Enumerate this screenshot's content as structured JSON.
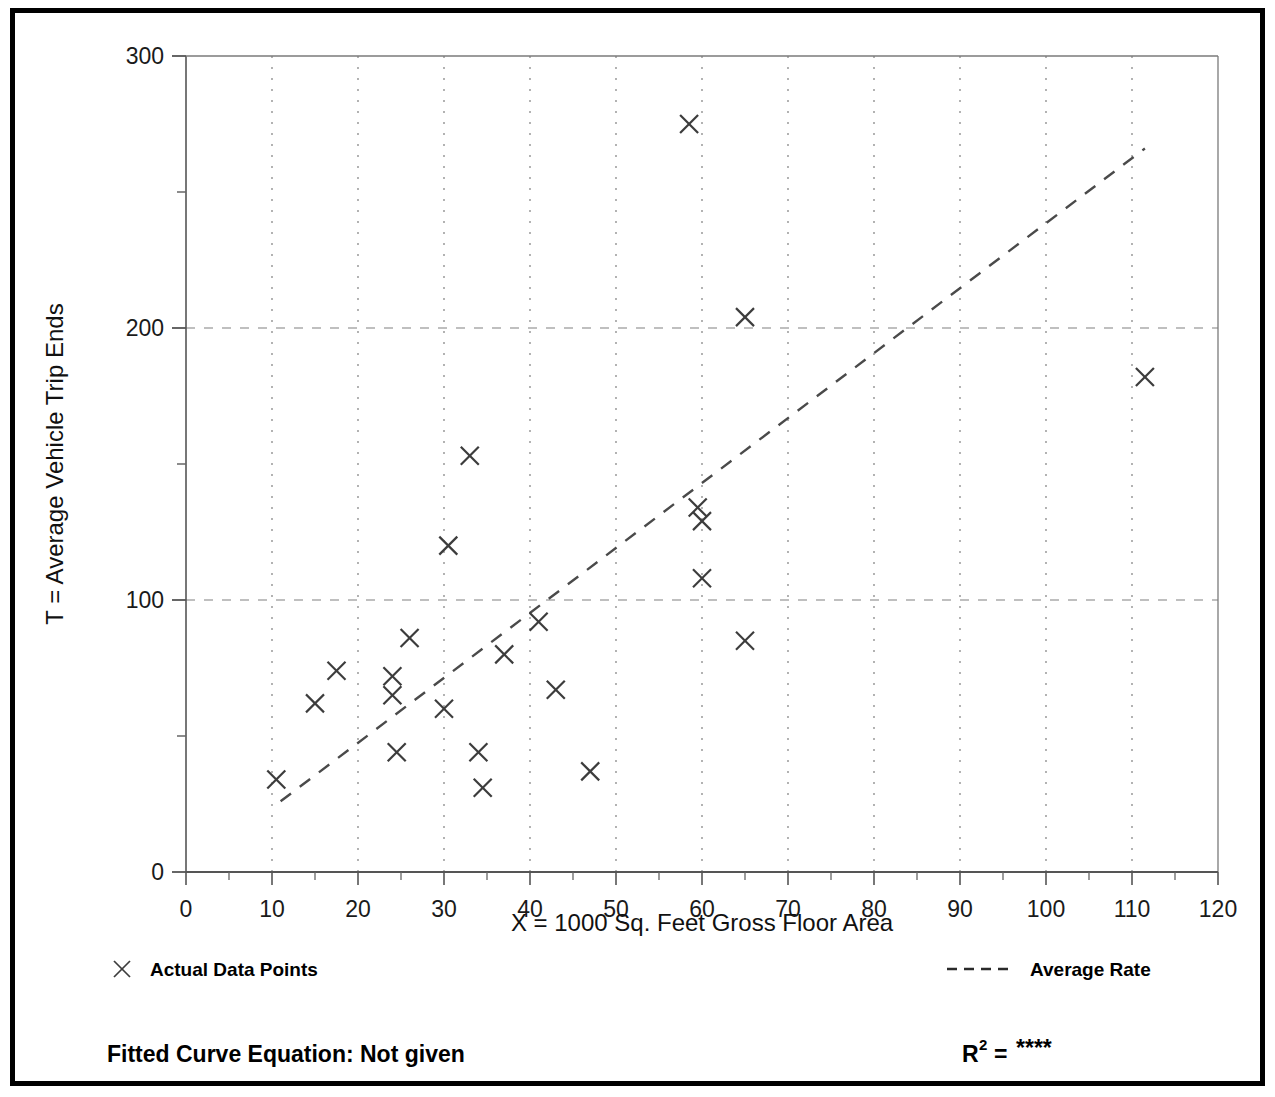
{
  "chart_data": {
    "type": "scatter",
    "title": "",
    "xlabel": "X = 1000 Sq. Feet Gross Floor Area",
    "ylabel": "T = Average Vehicle Trip Ends",
    "xlim": [
      0,
      120
    ],
    "ylim": [
      0,
      300
    ],
    "xticks": [
      0,
      10,
      20,
      30,
      40,
      50,
      60,
      70,
      80,
      90,
      100,
      110,
      120
    ],
    "yticks": [
      0,
      100,
      200,
      300
    ],
    "y_minor_ticks": [
      50,
      150,
      250
    ],
    "grid": "dotted-both-axes",
    "legend_position": "below-plot",
    "series": [
      {
        "name": "Actual Data Points",
        "marker": "x",
        "points": [
          {
            "x": 10.5,
            "y": 34
          },
          {
            "x": 15.0,
            "y": 62
          },
          {
            "x": 17.5,
            "y": 74
          },
          {
            "x": 24.0,
            "y": 72
          },
          {
            "x": 24.0,
            "y": 65
          },
          {
            "x": 24.5,
            "y": 44
          },
          {
            "x": 26.0,
            "y": 86
          },
          {
            "x": 30.0,
            "y": 60
          },
          {
            "x": 30.5,
            "y": 120
          },
          {
            "x": 33.0,
            "y": 153
          },
          {
            "x": 34.0,
            "y": 44
          },
          {
            "x": 34.5,
            "y": 31
          },
          {
            "x": 37.0,
            "y": 80
          },
          {
            "x": 41.0,
            "y": 92
          },
          {
            "x": 43.0,
            "y": 67
          },
          {
            "x": 47.0,
            "y": 37
          },
          {
            "x": 58.5,
            "y": 275
          },
          {
            "x": 59.5,
            "y": 134
          },
          {
            "x": 60.0,
            "y": 129
          },
          {
            "x": 60.0,
            "y": 108
          },
          {
            "x": 65.0,
            "y": 204
          },
          {
            "x": 65.0,
            "y": 85
          },
          {
            "x": 111.5,
            "y": 182
          }
        ]
      },
      {
        "name": "Average Rate",
        "type": "line",
        "style": "dashed",
        "endpoints": [
          {
            "x": 11.0,
            "y": 26
          },
          {
            "x": 111.5,
            "y": 266
          }
        ]
      }
    ]
  },
  "axes": {
    "x_tick_labels": [
      "0",
      "10",
      "20",
      "30",
      "40",
      "50",
      "60",
      "70",
      "80",
      "90",
      "100",
      "110",
      "120"
    ],
    "y_tick_labels": [
      "0",
      "100",
      "200",
      "300"
    ],
    "x_axis_title": "X = 1000 Sq. Feet Gross Floor Area",
    "y_axis_title": "T = Average Vehicle Trip Ends"
  },
  "legend": {
    "data_points_label": "Actual Data Points",
    "average_rate_label": "Average Rate"
  },
  "footer": {
    "fitted_curve_label": "Fitted Curve Equation:  Not given",
    "r_squared_base": "R",
    "r_squared_exponent": "2",
    "r_squared_equals": "=",
    "r_squared_value": "****"
  },
  "colors": {
    "frame": "#000000",
    "axis": "#555555",
    "grid": "#808080",
    "marker": "#3c3c3c",
    "trendline": "#4a4a4a",
    "text": "#111111",
    "background": "#ffffff"
  }
}
